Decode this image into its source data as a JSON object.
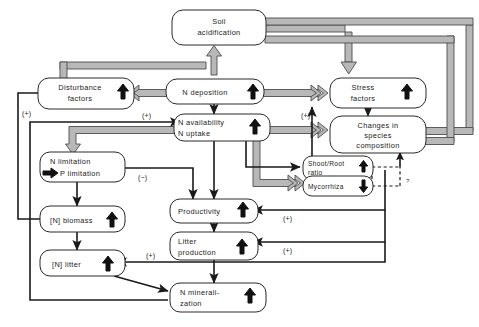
{
  "diagram": {
    "nodes": {
      "soil_acidification": {
        "line1": "Soil",
        "line2": "acidification",
        "trend": ""
      },
      "disturbance_factors": {
        "line1": "Disturbance",
        "line2": "factors",
        "trend": "up"
      },
      "n_deposition": {
        "line1": "N deposition",
        "line2": "",
        "trend": "up"
      },
      "stress_factors": {
        "line1": "Stress",
        "line2": "factors",
        "trend": "up"
      },
      "n_availability": {
        "line1": "N availability",
        "line2": "N uptake",
        "trend": "up"
      },
      "changes_species": {
        "line1": "Changes in",
        "line2": "species",
        "line3": "composition",
        "trend": ""
      },
      "n_limitation": {
        "line1": "N limitation",
        "line2": "P limitation",
        "trend": "arrow-right"
      },
      "shoot_root": {
        "line1": "Shoot/Root",
        "line2": "ratio",
        "trend": "up"
      },
      "mycorrhiza": {
        "line1": "Mycorrhiza",
        "line2": "",
        "trend": "down"
      },
      "n_biomass": {
        "line1": "[N] biomass",
        "line2": "",
        "trend": "up"
      },
      "productivity": {
        "line1": "Productivity",
        "line2": "",
        "trend": "up"
      },
      "n_litter": {
        "line1": "[N] litter",
        "line2": "",
        "trend": "up"
      },
      "litter_production": {
        "line1": "Litter",
        "line2": "production",
        "trend": "up"
      },
      "n_mineralization": {
        "line1": "N minerali-",
        "line2": "zation",
        "trend": "up"
      }
    },
    "sign_labels": {
      "plus_disturbance_feedback": "(+)",
      "plus_n_availability": "(+)",
      "plus_stress": "(+)",
      "minus_p_limitation": "(−)",
      "plus_productivity_feedback": "(+)",
      "plus_litter_feedback": "(+)",
      "plus_litter_n": "(+)",
      "question_mycorrhiza": "?"
    },
    "colors": {
      "fat_arrow_fill": "#b8b8b8",
      "fat_arrow_stroke": "#4d4d4d",
      "thin_arrow": "#1a1a1a",
      "box_stroke": "#2a2a2a",
      "background": "#ffffff"
    }
  }
}
